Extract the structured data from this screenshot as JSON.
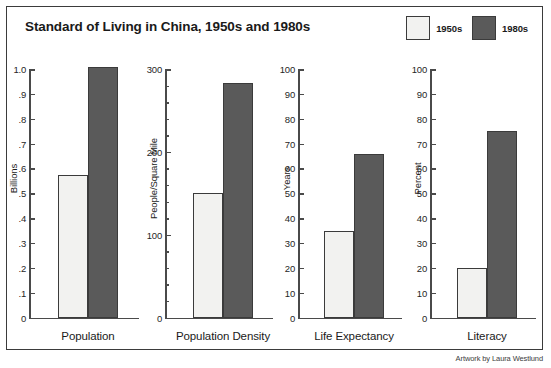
{
  "title": "Standard of Living in China, 1950s and 1980s",
  "credit": "Artwork by Laura Westlund",
  "colors": {
    "series_1950s": "#f2f2f0",
    "series_1980s": "#5a5a5a",
    "outline": "#3b3b3b",
    "axis": "#4a4a4a",
    "text": "#1a1a1a",
    "background": "#ffffff"
  },
  "legend": {
    "position": "top-right",
    "items": [
      {
        "label": "1950s",
        "swatch": "#f2f2f0"
      },
      {
        "label": "1980s",
        "swatch": "#5a5a5a"
      }
    ]
  },
  "chart_data": [
    {
      "type": "bar",
      "title": "Population",
      "categories": [
        "Population"
      ],
      "xlabel": "Population",
      "ylabel": "Billions",
      "ylim": [
        0,
        1.0
      ],
      "grid": false,
      "legend_position": "top-right",
      "tick_labels": [
        "1.0",
        ".9",
        ".8",
        ".7",
        ".6",
        ".5",
        ".4",
        ".3",
        ".2",
        ".1",
        "0"
      ],
      "tick_values": [
        1.0,
        0.9,
        0.8,
        0.7,
        0.6,
        0.5,
        0.4,
        0.3,
        0.2,
        0.1,
        0
      ],
      "minor_tick_values": [],
      "series": [
        {
          "name": "1950s",
          "values": [
            0.575
          ]
        },
        {
          "name": "1980s",
          "values": [
            1.01
          ]
        }
      ]
    },
    {
      "type": "bar",
      "title": "Population Density",
      "categories": [
        "Population Density"
      ],
      "xlabel": "Population Density",
      "ylabel": "People/Square Mile",
      "ylim": [
        0,
        300
      ],
      "grid": false,
      "legend_position": "top-right",
      "tick_labels": [
        "300",
        "200",
        "100",
        "0"
      ],
      "tick_values": [
        300,
        200,
        100,
        0
      ],
      "minor_tick_values": [
        280,
        260,
        240,
        220,
        180,
        160,
        140,
        120,
        80,
        60,
        40,
        20
      ],
      "series": [
        {
          "name": "1950s",
          "values": [
            150
          ]
        },
        {
          "name": "1980s",
          "values": [
            283
          ]
        }
      ]
    },
    {
      "type": "bar",
      "title": "Life Expectancy",
      "categories": [
        "Life Expectancy"
      ],
      "xlabel": "Life Expectancy",
      "ylabel": "Years",
      "ylim": [
        0,
        100
      ],
      "grid": false,
      "legend_position": "top-right",
      "tick_labels": [
        "100",
        "90",
        "80",
        "70",
        "60",
        "50",
        "40",
        "30",
        "20",
        "10",
        "0"
      ],
      "tick_values": [
        100,
        90,
        80,
        70,
        60,
        50,
        40,
        30,
        20,
        10,
        0
      ],
      "minor_tick_values": [],
      "series": [
        {
          "name": "1950s",
          "values": [
            35
          ]
        },
        {
          "name": "1980s",
          "values": [
            66
          ]
        }
      ]
    },
    {
      "type": "bar",
      "title": "Literacy",
      "categories": [
        "Literacy"
      ],
      "xlabel": "Literacy",
      "ylabel": "Percent",
      "ylim": [
        0,
        100
      ],
      "grid": false,
      "legend_position": "top-right",
      "tick_labels": [
        "100",
        "90",
        "80",
        "70",
        "60",
        "50",
        "40",
        "30",
        "20",
        "10",
        "0"
      ],
      "tick_values": [
        100,
        90,
        80,
        70,
        60,
        50,
        40,
        30,
        20,
        10,
        0
      ],
      "minor_tick_values": [],
      "series": [
        {
          "name": "1950s",
          "values": [
            20
          ]
        },
        {
          "name": "1980s",
          "values": [
            75
          ]
        }
      ]
    }
  ]
}
